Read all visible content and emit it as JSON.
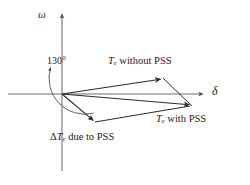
{
  "figure": {
    "kind": "phasor-diagram",
    "background_color": "#ffffff",
    "stroke_color": "#4a4a4a",
    "vector_color": "#2b2b2b",
    "text_color": "#1a1a1a",
    "width": 250,
    "height": 185
  },
  "axes": {
    "origin": {
      "x": 62,
      "y": 94
    },
    "vertical": {
      "name": "omega-axis",
      "label": "ω",
      "x": 62,
      "y_top": 12,
      "y_bottom": 172,
      "arrow": "up"
    },
    "horizontal": {
      "name": "delta-axis",
      "label": "δ",
      "y": 94,
      "x_left": 8,
      "x_right": 205,
      "arrow": "right"
    }
  },
  "angle_marker": {
    "label": "130°",
    "value": 130,
    "unit": "degrees",
    "from": "positive-omega-axis",
    "to": "delta-te-vector",
    "arrow_end": "counterclockwise-top"
  },
  "vectors": [
    {
      "id": "te-without-pss",
      "label": "T",
      "label_sub": "e",
      "label_rest": " without PSS",
      "full_label": "Te without PSS",
      "tip": {
        "x": 163,
        "y": 78
      }
    },
    {
      "id": "te-with-pss",
      "label": "T",
      "label_sub": "e",
      "label_rest": " with PSS",
      "full_label": "Te with PSS",
      "tip": {
        "x": 192,
        "y": 106
      }
    },
    {
      "id": "delta-te-due-to-pss",
      "label_pre": "Δ",
      "label": "T",
      "label_sub": "e",
      "label_rest": " due to PSS",
      "full_label": "ΔTe due to PSS",
      "tip": {
        "x": 95,
        "y": 122
      }
    }
  ],
  "closing_edges": [
    {
      "id": "edge-without-to-with",
      "from": {
        "x": 163,
        "y": 78
      },
      "to": {
        "x": 192,
        "y": 106
      }
    },
    {
      "id": "edge-deltate-to-with",
      "from": {
        "x": 95,
        "y": 122
      },
      "to": {
        "x": 192,
        "y": 106
      }
    }
  ]
}
